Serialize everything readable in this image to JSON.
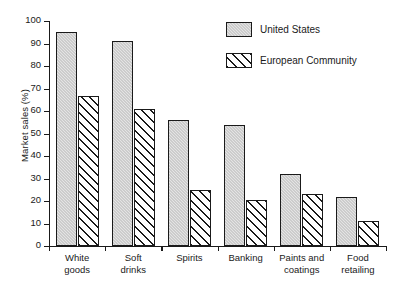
{
  "chart_data": {
    "type": "bar",
    "title": "",
    "xlabel": "",
    "ylabel": "Market sales (%)",
    "ylim": [
      0,
      100
    ],
    "ytick_step": 10,
    "yticks": [
      0,
      10,
      20,
      30,
      40,
      50,
      60,
      70,
      80,
      90,
      100
    ],
    "grid": false,
    "legend_position": "top-right",
    "categories": [
      "White\ngoods",
      "Soft\ndrinks",
      "Spirits",
      "Banking",
      "Paints and\ncoatings",
      "Food\nretailing"
    ],
    "series": [
      {
        "name": "United States",
        "fill": "light-gray-stipple",
        "color": "#e4e4e4",
        "values": [
          95,
          91,
          56,
          54,
          32,
          22
        ]
      },
      {
        "name": "European Community",
        "fill": "diagonal-hatch",
        "color": "#ffffff",
        "values": [
          66.5,
          61,
          25,
          20.5,
          23,
          11
        ]
      }
    ]
  },
  "legend": {
    "items": [
      {
        "label": "United States"
      },
      {
        "label": "European Community"
      }
    ]
  },
  "axis": {
    "y_title": "Market sales (%)"
  }
}
